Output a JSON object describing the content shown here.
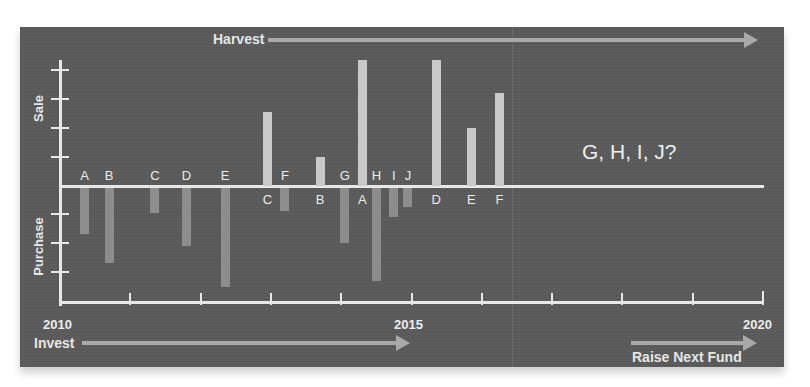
{
  "diagram": {
    "title_top_arrow": "Harvest",
    "bottom_left_arrow": "Invest",
    "bottom_right_arrow": "Raise Next Fund",
    "y_label_top": "Sale",
    "y_label_bottom": "Purchase",
    "annotation": "G, H, I, J?",
    "x_axis": {
      "start_label": "2010",
      "mid_label": "2015",
      "end_label": "2020",
      "tick_count": 11
    },
    "colors": {
      "background": "#5b5b5b",
      "axis": "#e8e8e8",
      "sale_bar": "#c9c9c9",
      "purchase_bar": "#8d8d8d",
      "arrow": "#a9a9a9"
    }
  },
  "chart_data": {
    "type": "bar",
    "title": "",
    "xlabel": "Year (2010–2020)",
    "ylabel": "Sale (up) / Purchase (down)",
    "x_range": [
      2010,
      2020
    ],
    "y_ticks_sale": 4,
    "y_ticks_purchase": 3,
    "purchases": [
      {
        "label": "A",
        "year": 2010.35,
        "value": 1.6
      },
      {
        "label": "B",
        "year": 2010.7,
        "value": 2.6
      },
      {
        "label": "C",
        "year": 2011.35,
        "value": 0.85
      },
      {
        "label": "D",
        "year": 2011.8,
        "value": 2.0
      },
      {
        "label": "E",
        "year": 2012.35,
        "value": 3.4
      },
      {
        "label": "F",
        "year": 2013.2,
        "value": 0.8
      },
      {
        "label": "G",
        "year": 2014.05,
        "value": 1.9
      },
      {
        "label": "H",
        "year": 2014.5,
        "value": 3.2
      },
      {
        "label": "I",
        "year": 2014.75,
        "value": 1.0
      },
      {
        "label": "J",
        "year": 2014.95,
        "value": 0.65
      }
    ],
    "sales": [
      {
        "label": "C",
        "year": 2012.95,
        "value": 2.55
      },
      {
        "label": "B",
        "year": 2013.7,
        "value": 1.0
      },
      {
        "label": "A",
        "year": 2014.3,
        "value": 4.35
      },
      {
        "label": "D",
        "year": 2015.35,
        "value": 4.35
      },
      {
        "label": "E",
        "year": 2015.85,
        "value": 2.0
      },
      {
        "label": "F",
        "year": 2016.25,
        "value": 3.2
      }
    ],
    "annotations": [
      "Harvest →",
      "Invest →",
      "Raise Next Fund →",
      "G, H, I, J?"
    ],
    "grid": false,
    "legend": null
  }
}
